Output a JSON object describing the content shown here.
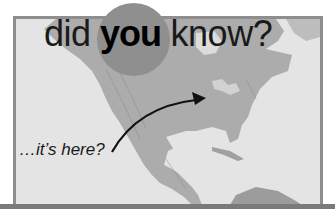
{
  "heading": {
    "word1": "did",
    "word2": "you",
    "word3": "know?"
  },
  "caption": "…it’s here?",
  "map": {
    "region": "North and Central America",
    "style": "grayscale relief"
  },
  "colors": {
    "frame_border": "#8e8e8e",
    "map_background": "#e4e4e4",
    "land": "#a8a8a8",
    "circle": "#8f8f8f",
    "text": "#1a1a1a",
    "bottom_bar": "#7a7a7a"
  },
  "icons": {
    "arrow": "curved-arrow-pointing-to-great-lakes"
  }
}
